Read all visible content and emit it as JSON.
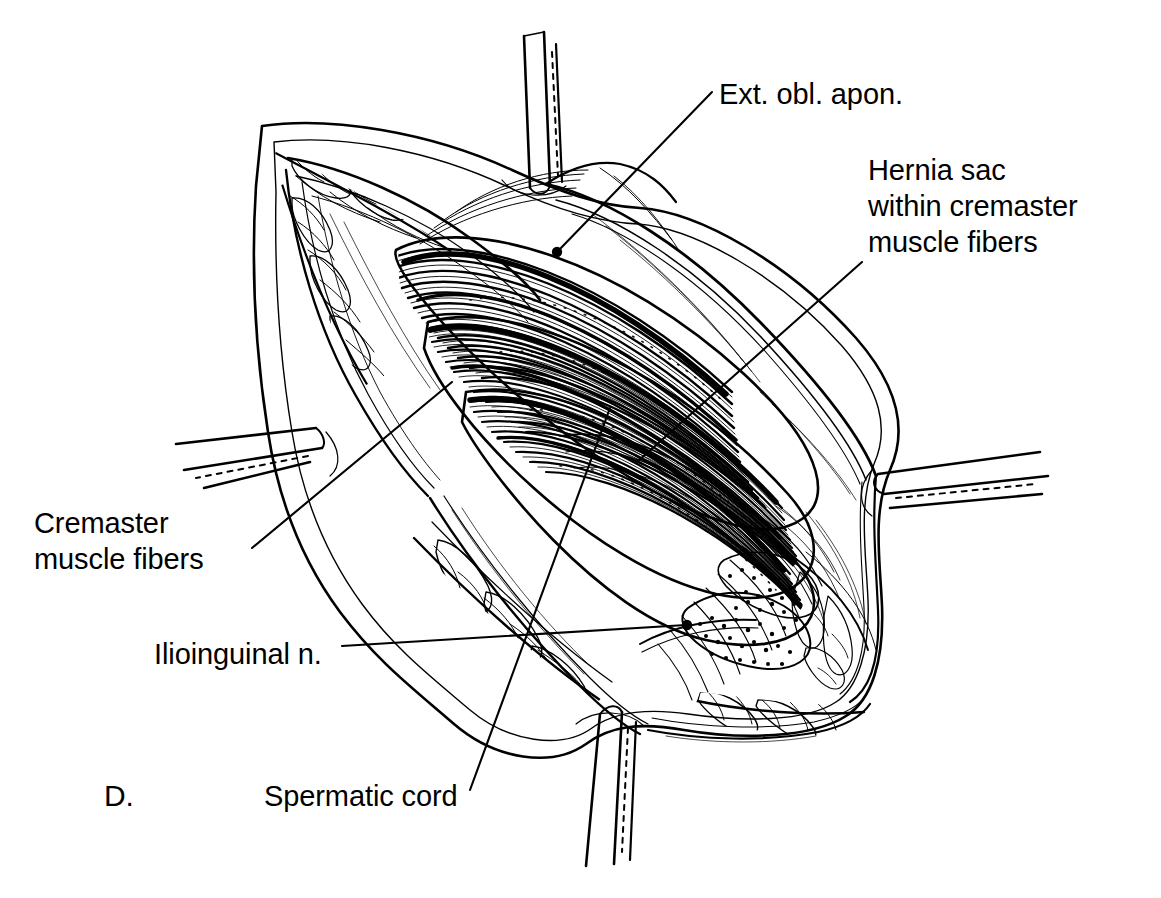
{
  "figure": {
    "panel_letter": "D.",
    "type": "line-art surgical illustration",
    "ink_color": "#000000",
    "background_color": "#ffffff"
  },
  "labels": {
    "ext_obl_apon": "Ext. obl. apon.",
    "hernia_sac": "Hernia sac\nwithin cremaster\nmuscle fibers",
    "cremaster": "Cremaster\nmuscle fibers",
    "ilioinguinal": "Ilioinguinal n.",
    "spermatic_cord": "Spermatic cord"
  },
  "leaders": [
    {
      "name": "ext-obl-apon",
      "from": [
        712,
        92
      ],
      "to": [
        557,
        252
      ],
      "dot": true
    },
    {
      "name": "hernia-sac",
      "from": [
        862,
        262
      ],
      "to": [
        637,
        462
      ],
      "dot": false
    },
    {
      "name": "cremaster",
      "from": [
        252,
        548
      ],
      "to": [
        452,
        382
      ],
      "dot": false
    },
    {
      "name": "ilioinguinal",
      "from": [
        342,
        646
      ],
      "to": [
        688,
        626
      ],
      "dot": true
    },
    {
      "name": "spermatic-cord",
      "from": [
        470,
        790
      ],
      "to": [
        610,
        408
      ],
      "dot": false
    }
  ],
  "instruments": [
    {
      "name": "retractor-top",
      "position": "top",
      "angle_deg": 8
    },
    {
      "name": "retractor-left",
      "position": "left",
      "angle_deg": -12
    },
    {
      "name": "retractor-right",
      "position": "right",
      "angle_deg": 6
    },
    {
      "name": "retractor-bottom",
      "position": "bottom",
      "angle_deg": -6
    }
  ],
  "anatomy": [
    {
      "name": "skin-edge",
      "note": "wound margin, outer cut edge"
    },
    {
      "name": "subcutaneous-fat",
      "note": "lobulated fat along wound edges"
    },
    {
      "name": "external-oblique-aponeurosis",
      "note": "glistening sheet retracted to both sides"
    },
    {
      "name": "cremaster-muscle-fibers",
      "note": "striated fibers sweeping over cord"
    },
    {
      "name": "hernia-sac",
      "note": "within cremaster fibers, stippled"
    },
    {
      "name": "spermatic-cord",
      "note": "beneath cremaster fibers"
    },
    {
      "name": "ilioinguinal-nerve",
      "note": "running on the cord, lower pole"
    }
  ]
}
